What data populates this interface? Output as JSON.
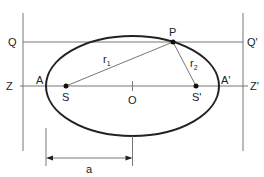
{
  "diagram": {
    "type": "ellipse-geometry",
    "labels": {
      "Q": "Q",
      "Q_prime": "Q'",
      "Z": "Z",
      "Z_prime": "Z'",
      "A": "A",
      "A_prime": "A'",
      "S": "S",
      "S_prime": "S'",
      "O": "O",
      "P": "P",
      "r1_base": "r",
      "r1_sub": "1",
      "r2_base": "r",
      "r2_sub": "2",
      "a": "a"
    },
    "colors": {
      "ellipse": "#222222",
      "lines": "#777777",
      "background": "#ffffff"
    }
  }
}
